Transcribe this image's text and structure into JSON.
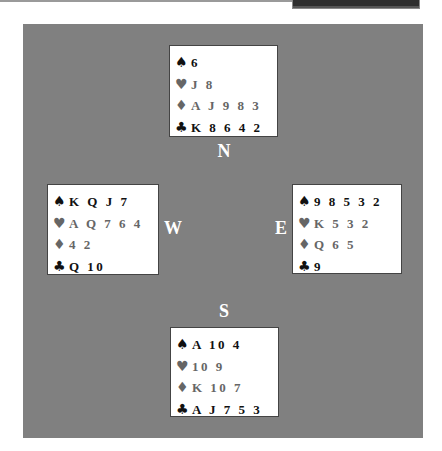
{
  "colors": {
    "table": "#808080",
    "card_box": "#ffffff",
    "black_suits": "#111111",
    "red_suits_rendered": "#666666",
    "seat_label": "#ffffff"
  },
  "icons": {
    "spade": "♠",
    "heart": "♥",
    "diamond": "♦",
    "club": "♣"
  },
  "seats": {
    "north": "N",
    "south": "S",
    "east": "E",
    "west": "W"
  },
  "hands": {
    "north": {
      "spades": "6",
      "hearts": "J 8",
      "diamonds": "A J 9 8 3",
      "clubs": "K 8 6 4 2"
    },
    "west": {
      "spades": "K Q J 7",
      "hearts": "A Q 7 6 4",
      "diamonds": "4 2",
      "clubs": "Q 10"
    },
    "east": {
      "spades": "9 8 5 3 2",
      "hearts": "K 5 3 2",
      "diamonds": "Q 6 5",
      "clubs": "9"
    },
    "south": {
      "spades": "A 10 4",
      "hearts": "10 9",
      "diamonds": "K 10 7",
      "clubs": "A J 7 5 3"
    }
  }
}
